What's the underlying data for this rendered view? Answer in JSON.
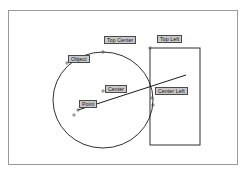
{
  "figure": {
    "title": "",
    "frame": {
      "x": 8,
      "y": 10,
      "width": 230,
      "height": 155,
      "border_color": "#9a9a9a",
      "background": "#ffffff"
    },
    "stroke_color": "#1a1a1a",
    "label_fill": "#c8c8c8",
    "label_border": "#4a4a4a",
    "label_text_color": "#111111"
  },
  "shapes": [
    {
      "name": "circle-object",
      "type": "circle",
      "cx": 103,
      "cy": 100,
      "rx": 50,
      "ry": 48,
      "stroke": "#1a1a1a",
      "fill": "none"
    },
    {
      "name": "rectangle-left",
      "type": "rect",
      "x": 150,
      "y": 48,
      "width": 50,
      "height": 97,
      "stroke": "#1a1a1a",
      "fill": "none"
    },
    {
      "name": "ray-line",
      "type": "line",
      "x1": 78,
      "y1": 110,
      "x2": 186,
      "y2": 75,
      "stroke": "#1a1a1a"
    }
  ],
  "markers": [
    {
      "name": "marker-top-center-anchor",
      "x": 103,
      "y": 52
    },
    {
      "name": "marker-object-anchor",
      "x": 67,
      "y": 63
    },
    {
      "name": "marker-center",
      "x": 103,
      "y": 91
    },
    {
      "name": "marker-point",
      "x": 78,
      "y": 110
    },
    {
      "name": "marker-point-lower",
      "x": 74,
      "y": 115
    },
    {
      "name": "marker-top-left-anchor",
      "x": 150,
      "y": 48
    },
    {
      "name": "marker-center-left",
      "x": 152,
      "y": 98
    },
    {
      "name": "marker-center-left-lower",
      "x": 153,
      "y": 105
    }
  ],
  "annotations": {
    "top_center": "Top Center",
    "top_left": "Top Left",
    "object": "Object",
    "center": "Center",
    "center_left": "Center Left",
    "point": "Point"
  }
}
